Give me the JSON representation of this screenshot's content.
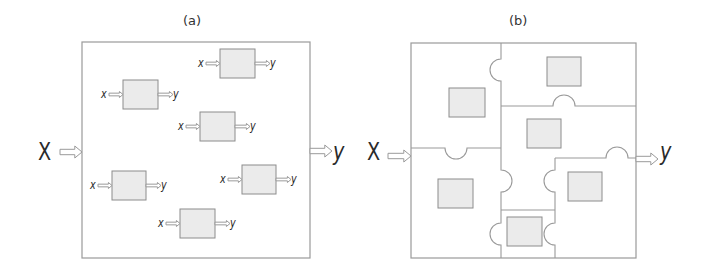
{
  "colors": {
    "stroke": "#9a9a9a",
    "module_fill": "#ebebeb",
    "module_stroke": "#8c8c8c",
    "text": "#2a2a2a",
    "arrow_fill": "#ffffff"
  },
  "panels": [
    {
      "id": "a",
      "label": "(a)",
      "label_pos": [
        183,
        22
      ],
      "frame": {
        "x": 82,
        "y": 42,
        "w": 228,
        "h": 216
      },
      "input": {
        "label": "X",
        "label_pos": [
          38,
          140
        ],
        "arrow": [
          60,
          152,
          82
        ]
      },
      "output": {
        "label": "y",
        "label_pos": [
          333,
          140
        ],
        "arrow": [
          310,
          151,
          332
        ]
      },
      "modules": [
        {
          "box": [
            220,
            49,
            35,
            29
          ],
          "in_label": "x",
          "out_label": "y"
        },
        {
          "box": [
            123,
            80,
            35,
            29
          ],
          "in_label": "x",
          "out_label": "y"
        },
        {
          "box": [
            200,
            112,
            35,
            29
          ],
          "in_label": "x",
          "out_label": "y"
        },
        {
          "box": [
            112,
            171,
            34,
            29
          ],
          "in_label": "x",
          "out_label": "y"
        },
        {
          "box": [
            242,
            165,
            34,
            29
          ],
          "in_label": "x",
          "out_label": "y"
        },
        {
          "box": [
            180,
            209,
            35,
            29
          ],
          "in_label": "x",
          "out_label": "y"
        }
      ]
    },
    {
      "id": "b",
      "label": "(b)",
      "label_pos": [
        509,
        22
      ],
      "frame": {
        "x": 411,
        "y": 43,
        "w": 225,
        "h": 215
      },
      "input": {
        "label": "X",
        "label_pos": [
          367,
          140
        ],
        "arrow": [
          388,
          156,
          411
        ]
      },
      "output": {
        "label": "y",
        "label_pos": [
          660,
          140
        ],
        "arrow": [
          636,
          159,
          658
        ]
      },
      "pieces": [
        {
          "name": "top-left-piece",
          "module": [
            449,
            88,
            36,
            29
          ]
        },
        {
          "name": "top-right-piece",
          "module": [
            547,
            57,
            34,
            29
          ]
        },
        {
          "name": "middle-piece",
          "module": [
            527,
            119,
            34,
            29
          ]
        },
        {
          "name": "bottom-left-piece",
          "module": [
            438,
            179,
            35,
            29
          ]
        },
        {
          "name": "right-piece",
          "module": [
            568,
            172,
            34,
            29
          ]
        },
        {
          "name": "bottom-center-piece",
          "module": [
            507,
            217,
            35,
            29
          ]
        }
      ]
    }
  ]
}
